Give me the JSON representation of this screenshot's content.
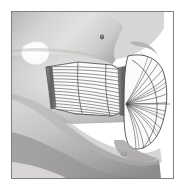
{
  "figure": {
    "kind": "anatomical-illustration",
    "style": "grayscale halftone line drawing",
    "frame": {
      "border_color": "#7d7f82",
      "border_width_px": 1,
      "background": "#ffffff",
      "x": 11,
      "y": 11,
      "width": 163,
      "height": 168
    },
    "canvas": {
      "width": 187,
      "height": 193,
      "background": "#ffffff"
    },
    "palette": {
      "skin_light": "#e8e6e4",
      "skin_mid": "#c9c7c5",
      "skin_dark": "#9b9a99",
      "shadow": "#7a7a79",
      "deep_shadow": "#5d5d5c",
      "muscle_fill": "#fbfbfa",
      "muscle_outline": "#4a4a4a",
      "fiber_line": "#3f3f3f",
      "tendon_band": "#6e6e6e",
      "ear_highlight": "#ffffff"
    },
    "parts": [
      {
        "name": "face-profile",
        "label": "Lateral face and mandible silhouette"
      },
      {
        "name": "ear-highlight",
        "label": "Ear / external auditory region highlight"
      },
      {
        "name": "masseter-superficial",
        "label": "Superficial part of masseter, horizontal striated fibers"
      },
      {
        "name": "masseter-deep-fan",
        "label": "Deep fan-shaped portion with radiating fibers"
      },
      {
        "name": "tendon-band-anterior",
        "label": "Anterior tendinous band"
      },
      {
        "name": "tendon-band-posterior",
        "label": "Posterior tendinous band"
      },
      {
        "name": "landmark-dot-upper",
        "label": "Upper facial landmark marking"
      },
      {
        "name": "landmark-dot-lower",
        "label": "Lower mandibular landmark marking"
      }
    ]
  }
}
